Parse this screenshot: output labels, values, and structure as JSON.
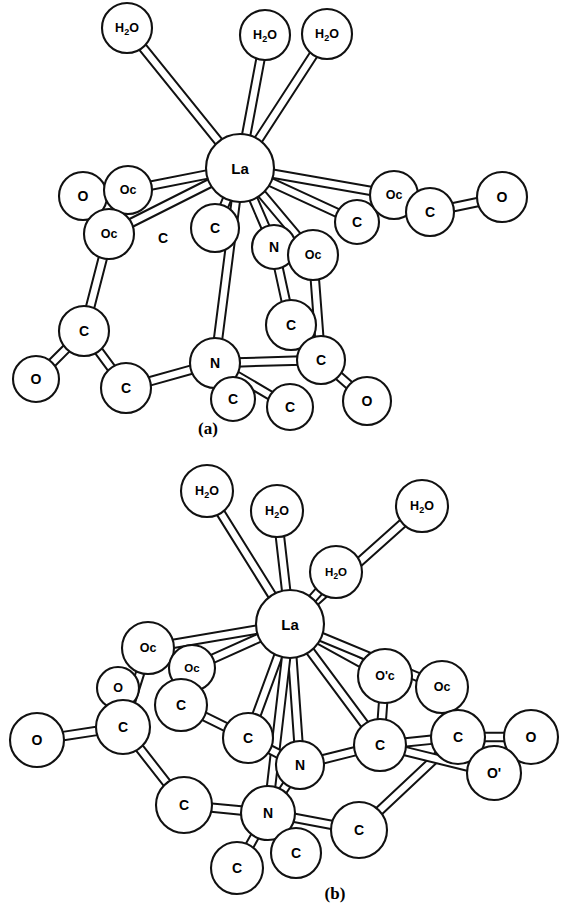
{
  "page": {
    "background_color": "#ffffff",
    "line_color": "#111111",
    "fill_color": "#ffffff",
    "width": 573,
    "height": 911
  },
  "chart_data": {
    "type": "diagram",
    "subtype": "ball-and-stick molecular structure",
    "title": "",
    "panels": [
      {
        "id": "a",
        "caption": "(a)",
        "caption_x": 208,
        "caption_y": 428,
        "center_atom": "La",
        "atom_counts": {
          "La": 1,
          "H2O": 3,
          "N": 2,
          "O": 4,
          "Oc": 4,
          "C": 10
        },
        "atoms": [
          {
            "id": "a-h2o-1",
            "label": "H2O",
            "x": 127,
            "y": 28,
            "r": 25,
            "size": "sm"
          },
          {
            "id": "a-h2o-2",
            "label": "H2O",
            "x": 265,
            "y": 35,
            "r": 25,
            "size": "sm"
          },
          {
            "id": "a-h2o-3",
            "label": "H2O",
            "x": 327,
            "y": 34,
            "r": 25,
            "size": "sm"
          },
          {
            "id": "a-la",
            "label": "La",
            "x": 240,
            "y": 168,
            "r": 34,
            "size": "lg"
          },
          {
            "id": "a-o-l1",
            "label": "O",
            "x": 83,
            "y": 196,
            "r": 24,
            "size": "md"
          },
          {
            "id": "a-oc-l1",
            "label": "Oc",
            "x": 128,
            "y": 190,
            "r": 24,
            "size": "sm"
          },
          {
            "id": "a-oc-l2",
            "label": "Oc",
            "x": 109,
            "y": 234,
            "r": 25,
            "size": "sm"
          },
          {
            "id": "a-c-l1",
            "label": "C",
            "x": 163,
            "y": 238,
            "r": 0,
            "size": "md",
            "bare": true
          },
          {
            "id": "a-c-m1",
            "label": "C",
            "x": 215,
            "y": 228,
            "r": 24,
            "size": "md"
          },
          {
            "id": "a-n-m1",
            "label": "N",
            "x": 274,
            "y": 247,
            "r": 22,
            "size": "md"
          },
          {
            "id": "a-oc-m1",
            "label": "Oc",
            "x": 313,
            "y": 255,
            "r": 25,
            "size": "sm"
          },
          {
            "id": "a-c-r1",
            "label": "C",
            "x": 357,
            "y": 222,
            "r": 22,
            "size": "md"
          },
          {
            "id": "a-oc-r1",
            "label": "Oc",
            "x": 394,
            "y": 195,
            "r": 24,
            "size": "sm"
          },
          {
            "id": "a-c-r2",
            "label": "C",
            "x": 430,
            "y": 212,
            "r": 24,
            "size": "md"
          },
          {
            "id": "a-o-r1",
            "label": "O",
            "x": 502,
            "y": 197,
            "r": 25,
            "size": "md"
          },
          {
            "id": "a-c-bl1",
            "label": "C",
            "x": 84,
            "y": 331,
            "r": 25,
            "size": "md"
          },
          {
            "id": "a-o-bl1",
            "label": "O",
            "x": 36,
            "y": 379,
            "r": 23,
            "size": "md"
          },
          {
            "id": "a-c-bl2",
            "label": "C",
            "x": 126,
            "y": 388,
            "r": 25,
            "size": "md"
          },
          {
            "id": "a-n-b1",
            "label": "N",
            "x": 215,
            "y": 363,
            "r": 25,
            "size": "md"
          },
          {
            "id": "a-c-b1",
            "label": "C",
            "x": 233,
            "y": 399,
            "r": 22,
            "size": "md"
          },
          {
            "id": "a-c-b2",
            "label": "C",
            "x": 290,
            "y": 407,
            "r": 23,
            "size": "md"
          },
          {
            "id": "a-c-br1",
            "label": "C",
            "x": 291,
            "y": 325,
            "r": 25,
            "size": "md"
          },
          {
            "id": "a-c-br2",
            "label": "C",
            "x": 321,
            "y": 360,
            "r": 24,
            "size": "md"
          },
          {
            "id": "a-o-br1",
            "label": "O",
            "x": 367,
            "y": 401,
            "r": 24,
            "size": "md"
          }
        ],
        "bonds": [
          {
            "from": "a-h2o-1",
            "to": "a-la"
          },
          {
            "from": "a-h2o-2",
            "to": "a-la"
          },
          {
            "from": "a-h2o-3",
            "to": "a-la"
          },
          {
            "from": "a-la",
            "to": "a-oc-l1"
          },
          {
            "from": "a-la",
            "to": "a-oc-l2"
          },
          {
            "from": "a-la",
            "to": "a-c-m1"
          },
          {
            "from": "a-la",
            "to": "a-n-m1"
          },
          {
            "from": "a-la",
            "to": "a-oc-m1"
          },
          {
            "from": "a-la",
            "to": "a-c-r1"
          },
          {
            "from": "a-la",
            "to": "a-oc-r1"
          },
          {
            "from": "a-la",
            "to": "a-n-b1"
          },
          {
            "from": "a-o-l1",
            "to": "a-oc-l1"
          },
          {
            "from": "a-oc-l2",
            "to": "a-c-bl1"
          },
          {
            "from": "a-c-bl1",
            "to": "a-o-bl1"
          },
          {
            "from": "a-c-bl1",
            "to": "a-c-bl2"
          },
          {
            "from": "a-c-bl2",
            "to": "a-n-b1"
          },
          {
            "from": "a-n-b1",
            "to": "a-c-b1"
          },
          {
            "from": "a-n-b1",
            "to": "a-c-b2"
          },
          {
            "from": "a-n-b1",
            "to": "a-c-br2"
          },
          {
            "from": "a-n-m1",
            "to": "a-c-br1"
          },
          {
            "from": "a-oc-m1",
            "to": "a-c-br2"
          },
          {
            "from": "a-c-br1",
            "to": "a-c-br2"
          },
          {
            "from": "a-c-br2",
            "to": "a-o-br1"
          },
          {
            "from": "a-c-r1",
            "to": "a-oc-r1"
          },
          {
            "from": "a-oc-r1",
            "to": "a-c-r2"
          },
          {
            "from": "a-c-r2",
            "to": "a-o-r1"
          }
        ]
      },
      {
        "id": "b",
        "caption": "(b)",
        "caption_x": 335,
        "caption_y": 893,
        "center_atom": "La",
        "atom_counts": {
          "La": 1,
          "H2O": 4,
          "N": 2,
          "O": 3,
          "Oc": 4,
          "C": 10
        },
        "atoms": [
          {
            "id": "b-h2o-1",
            "label": "H2O",
            "x": 207,
            "y": 491,
            "r": 26,
            "size": "sm"
          },
          {
            "id": "b-h2o-2",
            "label": "H2O",
            "x": 277,
            "y": 511,
            "r": 26,
            "size": "sm"
          },
          {
            "id": "b-h2o-3",
            "label": "H2O",
            "x": 422,
            "y": 506,
            "r": 26,
            "size": "sm"
          },
          {
            "id": "b-h2o-4",
            "label": "H2O",
            "x": 336,
            "y": 572,
            "r": 26,
            "size": "xs",
            "hidden_circle": true
          },
          {
            "id": "b-la",
            "label": "La",
            "x": 290,
            "y": 624,
            "r": 34,
            "size": "lg"
          },
          {
            "id": "b-oc-l1",
            "label": "Oc",
            "x": 148,
            "y": 648,
            "r": 26,
            "size": "sm"
          },
          {
            "id": "b-oc-l2",
            "label": "Oc",
            "x": 192,
            "y": 668,
            "r": 23,
            "size": "xs"
          },
          {
            "id": "b-o-l1",
            "label": "O",
            "x": 118,
            "y": 688,
            "r": 21,
            "size": "sm"
          },
          {
            "id": "b-c-l1",
            "label": "C",
            "x": 123,
            "y": 727,
            "r": 27,
            "size": "md"
          },
          {
            "id": "b-o-l2",
            "label": "O",
            "x": 37,
            "y": 740,
            "r": 27,
            "size": "md"
          },
          {
            "id": "b-c-l2",
            "label": "C",
            "x": 181,
            "y": 705,
            "r": 26,
            "size": "md"
          },
          {
            "id": "b-c-l3",
            "label": "C",
            "x": 248,
            "y": 738,
            "r": 25,
            "size": "md"
          },
          {
            "id": "b-c-l4",
            "label": "C",
            "x": 184,
            "y": 805,
            "r": 28,
            "size": "md"
          },
          {
            "id": "b-n-1",
            "label": "N",
            "x": 300,
            "y": 765,
            "r": 24,
            "size": "md"
          },
          {
            "id": "b-n-2",
            "label": "N",
            "x": 268,
            "y": 813,
            "r": 27,
            "size": "md"
          },
          {
            "id": "b-c-b1",
            "label": "C",
            "x": 237,
            "y": 868,
            "r": 26,
            "size": "md"
          },
          {
            "id": "b-c-b2",
            "label": "C",
            "x": 296,
            "y": 853,
            "r": 25,
            "size": "md"
          },
          {
            "id": "b-c-b3",
            "label": "C",
            "x": 359,
            "y": 830,
            "r": 28,
            "size": "md"
          },
          {
            "id": "b-oc-r1",
            "label": "O'c",
            "x": 385,
            "y": 676,
            "r": 27,
            "size": "sm"
          },
          {
            "id": "b-oc-r2",
            "label": "Oc",
            "x": 442,
            "y": 687,
            "r": 26,
            "size": "sm"
          },
          {
            "id": "b-c-r1",
            "label": "C",
            "x": 380,
            "y": 745,
            "r": 26,
            "size": "md"
          },
          {
            "id": "b-c-r2",
            "label": "C",
            "x": 458,
            "y": 737,
            "r": 27,
            "size": "md"
          },
          {
            "id": "b-o-r1",
            "label": "O",
            "x": 531,
            "y": 737,
            "r": 27,
            "size": "md"
          },
          {
            "id": "b-o-r2",
            "label": "O'",
            "x": 494,
            "y": 773,
            "r": 27,
            "size": "md"
          }
        ],
        "bonds": [
          {
            "from": "b-h2o-1",
            "to": "b-la"
          },
          {
            "from": "b-h2o-2",
            "to": "b-la"
          },
          {
            "from": "b-h2o-3",
            "to": "b-la"
          },
          {
            "from": "b-h2o-4",
            "to": "b-la"
          },
          {
            "from": "b-la",
            "to": "b-oc-l1"
          },
          {
            "from": "b-la",
            "to": "b-oc-l2"
          },
          {
            "from": "b-la",
            "to": "b-c-l3"
          },
          {
            "from": "b-la",
            "to": "b-n-1"
          },
          {
            "from": "b-la",
            "to": "b-n-2"
          },
          {
            "from": "b-la",
            "to": "b-oc-r1"
          },
          {
            "from": "b-la",
            "to": "b-c-r1"
          },
          {
            "from": "b-la",
            "to": "b-oc-r2"
          },
          {
            "from": "b-oc-l1",
            "to": "b-c-l1"
          },
          {
            "from": "b-o-l1",
            "to": "b-c-l1"
          },
          {
            "from": "b-oc-l2",
            "to": "b-c-l2"
          },
          {
            "from": "b-c-l1",
            "to": "b-o-l2"
          },
          {
            "from": "b-c-l1",
            "to": "b-c-l4"
          },
          {
            "from": "b-c-l2",
            "to": "b-c-l3"
          },
          {
            "from": "b-c-l4",
            "to": "b-n-2"
          },
          {
            "from": "b-c-l3",
            "to": "b-n-1"
          },
          {
            "from": "b-n-1",
            "to": "b-n-2"
          },
          {
            "from": "b-n-1",
            "to": "b-c-r1"
          },
          {
            "from": "b-n-2",
            "to": "b-c-b1"
          },
          {
            "from": "b-n-2",
            "to": "b-c-b2"
          },
          {
            "from": "b-n-2",
            "to": "b-c-b3"
          },
          {
            "from": "b-c-b3",
            "to": "b-c-r2"
          },
          {
            "from": "b-oc-r1",
            "to": "b-c-r1"
          },
          {
            "from": "b-oc-r2",
            "to": "b-c-r2"
          },
          {
            "from": "b-c-r1",
            "to": "b-c-r2"
          },
          {
            "from": "b-c-r2",
            "to": "b-o-r1"
          },
          {
            "from": "b-c-r1",
            "to": "b-o-r2"
          }
        ]
      }
    ]
  }
}
